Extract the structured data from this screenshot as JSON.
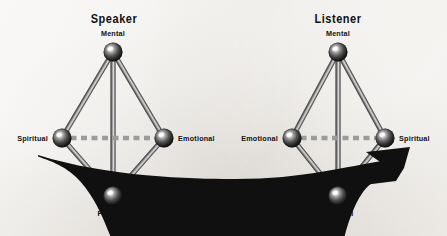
{
  "figure": {
    "background_color": "#ebe9e5",
    "ink_color": "#111111",
    "rod_color": "#8e8e8e",
    "dash_color": "#9b9b9b",
    "arrow_color": "#101010"
  },
  "panels": [
    {
      "id": "speaker",
      "title": "Speaker",
      "title_pos": {
        "x": 114,
        "y": 19
      },
      "nodes": [
        {
          "key": "mental",
          "label": "Mental",
          "cx": 113,
          "cy": 52,
          "r": 9.5,
          "label_pos": {
            "x": 113,
            "y": 34
          },
          "label_anchor": "center"
        },
        {
          "key": "spiritual",
          "label": "Spiritual",
          "cx": 62,
          "cy": 138,
          "r": 9.5,
          "label_pos": {
            "x": 48,
            "y": 139
          },
          "label_anchor": "right"
        },
        {
          "key": "emotional",
          "label": "Emotional",
          "cx": 164,
          "cy": 138,
          "r": 9.5,
          "label_pos": {
            "x": 178,
            "y": 139
          },
          "label_anchor": "left"
        },
        {
          "key": "physical",
          "label": "Physical",
          "cx": 113,
          "cy": 196,
          "r": 9.5,
          "label_pos": {
            "x": 113,
            "y": 214
          },
          "label_anchor": "center"
        }
      ],
      "rods": [
        {
          "from": "mental",
          "to": "spiritual"
        },
        {
          "from": "mental",
          "to": "emotional"
        },
        {
          "from": "mental",
          "to": "physical"
        },
        {
          "from": "spiritual",
          "to": "physical"
        },
        {
          "from": "emotional",
          "to": "physical"
        }
      ],
      "dashed_link": {
        "from": "spiritual",
        "to": "emotional"
      }
    },
    {
      "id": "listener",
      "title": "Listener",
      "title_pos": {
        "x": 338,
        "y": 19
      },
      "nodes": [
        {
          "key": "mental",
          "label": "Mental",
          "cx": 338,
          "cy": 52,
          "r": 9.5,
          "label_pos": {
            "x": 338,
            "y": 34
          },
          "label_anchor": "center"
        },
        {
          "key": "emotional",
          "label": "Emotional",
          "cx": 292,
          "cy": 138,
          "r": 9.5,
          "label_pos": {
            "x": 278,
            "y": 139
          },
          "label_anchor": "right"
        },
        {
          "key": "spiritual",
          "label": "Spiritual",
          "cx": 385,
          "cy": 138,
          "r": 9.5,
          "label_pos": {
            "x": 399,
            "y": 139
          },
          "label_anchor": "left"
        },
        {
          "key": "physical",
          "label": "Physical",
          "cx": 338,
          "cy": 196,
          "r": 9.5,
          "label_pos": {
            "x": 338,
            "y": 214
          },
          "label_anchor": "center"
        }
      ],
      "rods": [
        {
          "from": "mental",
          "to": "emotional"
        },
        {
          "from": "mental",
          "to": "spiritual"
        },
        {
          "from": "mental",
          "to": "physical"
        },
        {
          "from": "emotional",
          "to": "physical"
        },
        {
          "from": "spiritual",
          "to": "physical"
        }
      ],
      "dashed_link": {
        "from": "emotional",
        "to": "spiritual"
      }
    }
  ],
  "flow_arrow": {
    "name": "speaker-to-listener-arrow",
    "direction": "left-to-right",
    "tail": {
      "x": 38,
      "y": 155
    },
    "lowest": {
      "x": 232,
      "y": 179
    },
    "tip": {
      "x": 410,
      "y": 147
    },
    "color": "#101010"
  }
}
